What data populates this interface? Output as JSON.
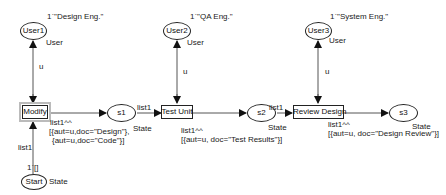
{
  "places": {
    "user1": {
      "name": "User1",
      "type": "User",
      "marking": "1`\"Design Eng.\""
    },
    "user2": {
      "name": "User2",
      "type": "User",
      "marking": "1`\"QA Eng.\""
    },
    "user3": {
      "name": "User3",
      "type": "User",
      "marking": "1`\"System Eng.\""
    },
    "start": {
      "name": "Start",
      "type": "State",
      "marking": "1`[]"
    },
    "s1": {
      "name": "s1",
      "type": "State"
    },
    "s2": {
      "name": "s2",
      "type": "State"
    },
    "s3": {
      "name": "s3",
      "type": "State"
    }
  },
  "transitions": {
    "modify": {
      "name": "Modify"
    },
    "test_unit": {
      "name": "Test Unit"
    },
    "review_design": {
      "name": "Review Design"
    }
  },
  "arcs": {
    "user1_modify": "u",
    "user2_test": "u",
    "user3_review": "u",
    "start_modify": "list1",
    "modify_s1_line1": "list1^^",
    "modify_s1_line2": "[{aut=u,doc=\"Design\"},",
    "modify_s1_line3": "{aut=u,doc=\"Code\"}]",
    "s1_test": "list1",
    "test_s2_line1": "list1^^",
    "test_s2_line2": "[{aut=u, doc=\"Test Results\"}]",
    "s2_review": "list1",
    "review_s3_line1": "list1^^",
    "review_s3_line2": "[{aut=u, doc=\"Design Review\"}]"
  }
}
